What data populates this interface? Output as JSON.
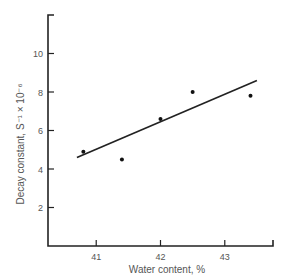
{
  "chart_data": {
    "type": "scatter",
    "title": "",
    "xlabel": "Water content, %",
    "ylabel": "Decay constant, S⁻¹ × 10⁻⁶",
    "xlim": [
      40.25,
      43.75
    ],
    "ylim": [
      0,
      12
    ],
    "x_ticks": [
      41,
      42,
      43
    ],
    "y_ticks": [
      2,
      4,
      6,
      8,
      10
    ],
    "grid": false,
    "legend": null,
    "series": [
      {
        "name": "measurements",
        "kind": "points",
        "x": [
          40.8,
          41.4,
          42.0,
          42.5,
          43.4
        ],
        "y": [
          4.9,
          4.5,
          6.6,
          8.0,
          7.8
        ]
      },
      {
        "name": "fit line",
        "kind": "line",
        "x": [
          40.7,
          43.5
        ],
        "y": [
          4.6,
          8.6
        ]
      }
    ]
  },
  "labels": {
    "xlabel": "Water content, %",
    "ylabel": "Decay constant, S⁻¹ × 10⁻⁶"
  },
  "colors": {
    "axis": "#222222",
    "text": "#555555",
    "line": "#222222",
    "points": "#111111"
  }
}
